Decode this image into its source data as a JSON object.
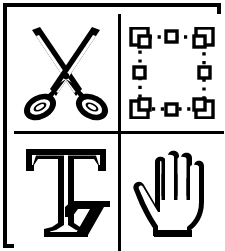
{
  "palette": {
    "title": "Tool Palette",
    "colors": {
      "ink": "#000000",
      "paper": "#ffffff"
    },
    "layout": {
      "columns": 2,
      "rows": 2,
      "width": 224,
      "height": 251
    },
    "tools": [
      {
        "id": "cut",
        "icon": "scissors-icon",
        "label": "Scissors",
        "position": "top-left",
        "selected": false
      },
      {
        "id": "select",
        "icon": "selection-marquee-icon",
        "label": "Selection",
        "position": "top-right",
        "selected": false,
        "handles": {
          "corner_count": 4,
          "midpoint_count": 4,
          "border_style": "dotted"
        }
      },
      {
        "id": "text",
        "icon": "text-tool-icon",
        "label": "Text",
        "position": "bottom-left",
        "selected": false,
        "glyph": "T"
      },
      {
        "id": "pan",
        "icon": "hand-icon",
        "label": "Hand",
        "position": "bottom-right",
        "selected": false
      }
    ]
  }
}
